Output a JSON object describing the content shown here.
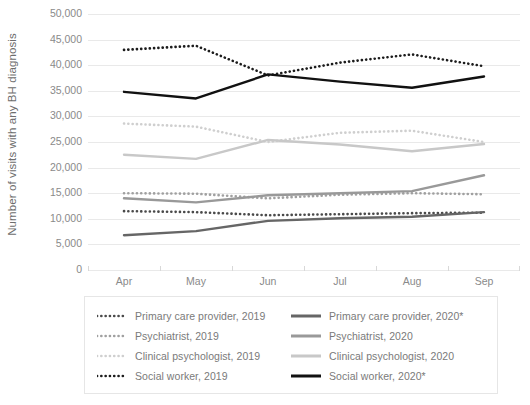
{
  "chart_data": {
    "type": "line",
    "title": "",
    "xlabel": "",
    "ylabel": "Number of visits with any BH diagnosis",
    "x": [
      "Apr",
      "May",
      "Jun",
      "Jul",
      "Aug",
      "Sep"
    ],
    "ylim": [
      0,
      50000
    ],
    "ytick_labels": [
      "50,000",
      "45,000",
      "40,000",
      "35,000",
      "30,000",
      "25,000",
      "20,000",
      "15,000",
      "10,000",
      "5,000",
      "0"
    ],
    "ytick_values": [
      50000,
      45000,
      40000,
      35000,
      30000,
      25000,
      20000,
      15000,
      10000,
      5000,
      0
    ],
    "grid": true,
    "legend_position": "bottom",
    "series": [
      {
        "name": "Primary care provider, 2019",
        "style": "dotted",
        "color": "#4a4a4a",
        "values": [
          11500,
          11300,
          10700,
          10900,
          11100,
          11200
        ]
      },
      {
        "name": "Psychiatrist, 2019",
        "style": "dotted",
        "color": "#a0a0a0",
        "values": [
          15000,
          14900,
          14000,
          14700,
          15000,
          14800
        ]
      },
      {
        "name": "Clinical psychologist, 2019",
        "style": "dotted",
        "color": "#cfcfcf",
        "values": [
          28600,
          28000,
          25000,
          26800,
          27200,
          25000
        ]
      },
      {
        "name": "Social worker, 2019",
        "style": "dotted",
        "color": "#1c1c1c",
        "values": [
          43000,
          43800,
          38000,
          40500,
          42100,
          39800
        ]
      },
      {
        "name": "Primary care provider, 2020*",
        "style": "solid",
        "color": "#666666",
        "values": [
          6800,
          7600,
          9600,
          10100,
          10400,
          11300
        ]
      },
      {
        "name": "Psychiatrist, 2020",
        "style": "solid",
        "color": "#999999",
        "values": [
          14000,
          13200,
          14600,
          15000,
          15400,
          18500
        ]
      },
      {
        "name": "Clinical psychologist, 2020",
        "style": "solid",
        "color": "#c8c8c8",
        "values": [
          22500,
          21700,
          25400,
          24500,
          23200,
          24600
        ]
      },
      {
        "name": "Social worker, 2020*",
        "style": "solid",
        "color": "#111111",
        "values": [
          34800,
          33500,
          38200,
          36800,
          35600,
          37800
        ]
      }
    ]
  },
  "axis": {
    "y_title": "Number of visits with any BH diagnosis"
  },
  "legend": {
    "left_column": [
      "Primary care provider, 2019",
      "Psychiatrist, 2019",
      "Clinical psychologist, 2019",
      "Social worker, 2019"
    ],
    "right_column": [
      "Primary care provider, 2020*",
      "Psychiatrist, 2020",
      "Clinical psychologist, 2020",
      "Social worker, 2020*"
    ]
  },
  "colors": {
    "grid": "#e9e9e9",
    "tick_text": "#8a8a8a",
    "legend_text": "#7a7a7a",
    "axis_title": "#6d6d6d",
    "legend_border": "#e6e6e6",
    "background": "#ffffff"
  }
}
